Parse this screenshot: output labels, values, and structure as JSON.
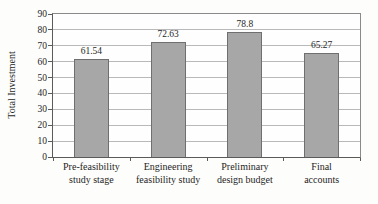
{
  "chart_data": {
    "type": "bar",
    "title": "",
    "ylabel": "Total Investment",
    "xlabel": "",
    "categories": [
      "Pre-feasibility study stage",
      "Engineering feasibility study",
      "Preliminary design budget",
      "Final accounts"
    ],
    "category_lines": [
      [
        "Pre-feasibility",
        "study stage"
      ],
      [
        "Engineering",
        "feasibility study"
      ],
      [
        "Preliminary",
        "design budget"
      ],
      [
        "Final",
        "accounts"
      ]
    ],
    "values": [
      61.54,
      72.63,
      78.8,
      65.27
    ],
    "value_labels": [
      "61.54",
      "72.63",
      "78.8",
      "65.27"
    ],
    "ylim": [
      0,
      90
    ],
    "yticks": [
      0,
      10,
      20,
      30,
      40,
      50,
      60,
      70,
      80,
      90
    ],
    "grid": "horizontal",
    "legend": "none",
    "colors": {
      "bar_fill": "#a7a7a7",
      "bar_border": "#6f6f6f",
      "gridline": "#b9b9b9",
      "plot_border": "#8a8a8a",
      "axis": "#5a5a5a",
      "text": "#1f1f1f",
      "background": "#fdfdfb"
    }
  }
}
